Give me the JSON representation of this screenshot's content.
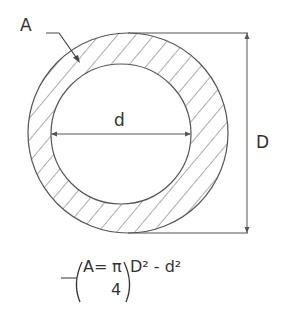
{
  "diagram": {
    "labels": {
      "area": "A",
      "inner_diameter": "d",
      "outer_diameter": "D"
    },
    "formula": {
      "lhs": "A=",
      "pi": "π",
      "denominator": "4",
      "open_paren": "(",
      "body": "D² - d²",
      "close_paren": ")"
    },
    "colors": {
      "line": "#555555",
      "text": "#333333",
      "background": "#ffffff"
    }
  }
}
